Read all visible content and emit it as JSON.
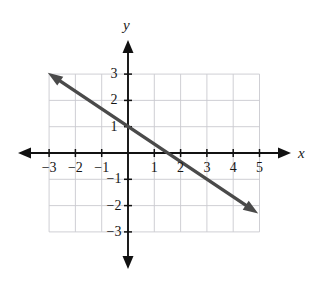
{
  "figure": {
    "kind": "cartesian-line-graph",
    "background_color": "#ffffff",
    "grid_color": "#c9c9cf",
    "axis_color": "#111111",
    "line_color": "#4a4a4a"
  },
  "axes": {
    "x_label": "x",
    "y_label": "y",
    "x_ticks": [
      {
        "value": -3,
        "label": "−3"
      },
      {
        "value": -2,
        "label": "−2"
      },
      {
        "value": -1,
        "label": "−1"
      },
      {
        "value": 1,
        "label": "1"
      },
      {
        "value": 2,
        "label": "2"
      },
      {
        "value": 3,
        "label": "3"
      },
      {
        "value": 4,
        "label": "4"
      },
      {
        "value": 5,
        "label": "5"
      }
    ],
    "y_ticks": [
      {
        "value": 3,
        "label": "3"
      },
      {
        "value": 2,
        "label": "2"
      },
      {
        "value": 1,
        "label": "1"
      },
      {
        "value": -1,
        "label": "−1"
      },
      {
        "value": -2,
        "label": "−2"
      },
      {
        "value": -3,
        "label": "−3"
      }
    ]
  },
  "chart_data": {
    "type": "line",
    "title": "",
    "xlabel": "x",
    "ylabel": "y",
    "xlim": [
      -3,
      5
    ],
    "ylim": [
      -3,
      3
    ],
    "grid": true,
    "legend": "none",
    "series": [
      {
        "name": "line",
        "equation": "y = -2/3 x + 1",
        "slope": -0.6667,
        "y_intercept": 1,
        "x_intercept": 1.5,
        "arrows": "both",
        "endpoints": [
          {
            "x": -3.05,
            "y": 3.05
          },
          {
            "x": 4.95,
            "y": -2.3
          }
        ],
        "points": [
          {
            "x": -3,
            "y": 3
          },
          {
            "x": 0,
            "y": 1
          },
          {
            "x": 1.5,
            "y": 0
          },
          {
            "x": 3,
            "y": -1
          },
          {
            "x": 4.5,
            "y": -2
          }
        ]
      }
    ],
    "x_tick_values": [
      -3,
      -2,
      -1,
      1,
      2,
      3,
      4,
      5
    ],
    "y_tick_values": [
      3,
      2,
      1,
      -1,
      -2,
      -3
    ]
  },
  "geometry": {
    "origin_px": {
      "x": 128,
      "y": 153
    },
    "unit_px": 26.3,
    "grid_bounds": {
      "x_min": -3,
      "x_max": 5,
      "y_min": -3,
      "y_max": 3
    }
  }
}
